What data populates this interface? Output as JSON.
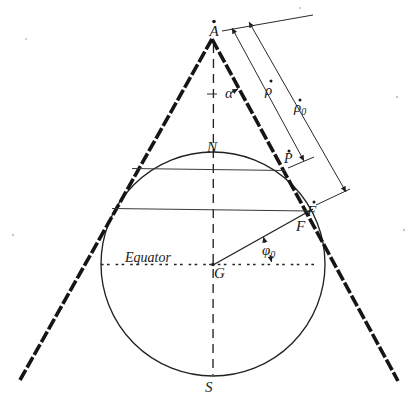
{
  "figure": {
    "colors": {
      "ink": "#1c1c1c",
      "thin_line": "#3a3a3a",
      "background": "#ffffff"
    },
    "labels": {
      "apex": "A",
      "half_apex_angle": "α",
      "slant_radius": "ρ",
      "slant_radius0_base": "ρ",
      "slant_radius0_sub": "0",
      "upper_parallel_point": "P",
      "lower_parallel_point_outer": "F",
      "lower_parallel_point_inner": "F",
      "latitude_base": "φ",
      "latitude_sub": "0",
      "north_pole": "N",
      "south_pole": "S",
      "globe_center": "G",
      "equator": "Equator"
    }
  }
}
